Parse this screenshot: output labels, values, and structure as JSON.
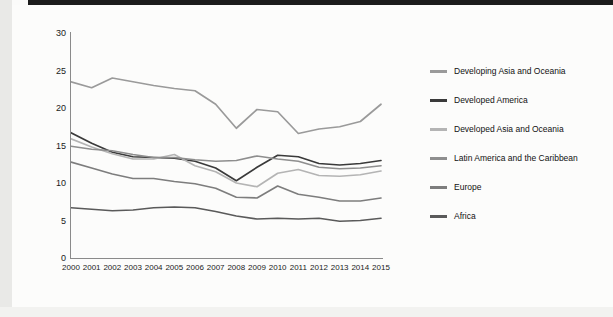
{
  "chart_data": {
    "type": "line",
    "title": "",
    "xlabel": "",
    "ylabel": "Per cent",
    "ylim": [
      0,
      30
    ],
    "ytick_step": 5,
    "yticks": [
      0,
      5,
      10,
      15,
      20,
      25,
      30
    ],
    "grid": false,
    "legend_position": "right",
    "categories": [
      "2000",
      "2001",
      "2002",
      "2003",
      "2004",
      "2005",
      "2006",
      "2007",
      "2008",
      "2009",
      "2010",
      "2011",
      "2012",
      "2013",
      "2014",
      "2015"
    ],
    "series": [
      {
        "name": "Developing Asia and Oceania",
        "color": "#9a9a9a",
        "values": [
          23.5,
          22.7,
          24.0,
          23.5,
          23.0,
          22.6,
          22.3,
          20.5,
          17.3,
          19.8,
          19.5,
          16.6,
          17.2,
          17.5,
          18.2,
          20.5
        ]
      },
      {
        "name": "Developed America",
        "color": "#3a3a3a",
        "values": [
          16.7,
          15.3,
          14.1,
          13.5,
          13.4,
          13.3,
          12.9,
          12.0,
          10.3,
          12.1,
          13.7,
          13.5,
          12.6,
          12.4,
          12.6,
          13.0
        ]
      },
      {
        "name": "Developed Asia and Oceania",
        "color": "#b4b4b4",
        "values": [
          15.9,
          14.8,
          13.9,
          13.2,
          13.2,
          13.8,
          12.3,
          11.5,
          10.0,
          9.5,
          11.3,
          11.8,
          11.0,
          10.9,
          11.1,
          11.6
        ]
      },
      {
        "name": "Latin America and the Caribbean",
        "color": "#8e8e8e",
        "values": [
          14.9,
          14.5,
          14.3,
          13.8,
          13.4,
          13.4,
          13.1,
          12.9,
          13.0,
          13.6,
          13.2,
          12.9,
          12.1,
          11.9,
          12.0,
          12.3
        ]
      },
      {
        "name": "Europe",
        "color": "#7d7d7d",
        "values": [
          12.8,
          12.0,
          11.2,
          10.6,
          10.6,
          10.2,
          9.9,
          9.3,
          8.1,
          8.0,
          9.6,
          8.5,
          8.1,
          7.6,
          7.6,
          8.0
        ]
      },
      {
        "name": "Africa",
        "color": "#5a5a5a",
        "values": [
          6.7,
          6.5,
          6.3,
          6.4,
          6.7,
          6.8,
          6.7,
          6.2,
          5.6,
          5.2,
          5.3,
          5.2,
          5.3,
          4.9,
          5.0,
          5.3
        ]
      }
    ]
  }
}
